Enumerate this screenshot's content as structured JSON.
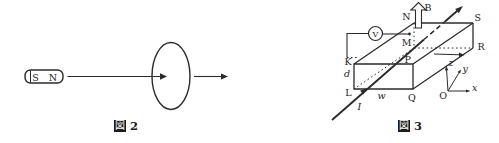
{
  "colors": {
    "ink": "#2b2b2b",
    "background": "#ffffff"
  },
  "figure2": {
    "caption": {
      "kanji": "図",
      "number": "2"
    },
    "magnet": {
      "left_pole": "S",
      "right_pole": "N"
    }
  },
  "figure3": {
    "caption": {
      "kanji": "図",
      "number": "3"
    },
    "vertex_labels": {
      "K": "K",
      "L": "L",
      "M": "M",
      "N": "N",
      "P": "P",
      "Q": "Q",
      "R": "R",
      "S": "S"
    },
    "dimension_labels": {
      "thickness": "d",
      "width": "w"
    },
    "field_label": "B",
    "current_label": "I",
    "voltmeter_label": "V",
    "axes": {
      "origin": "O",
      "x": "x",
      "y": "y",
      "z": "z"
    }
  }
}
